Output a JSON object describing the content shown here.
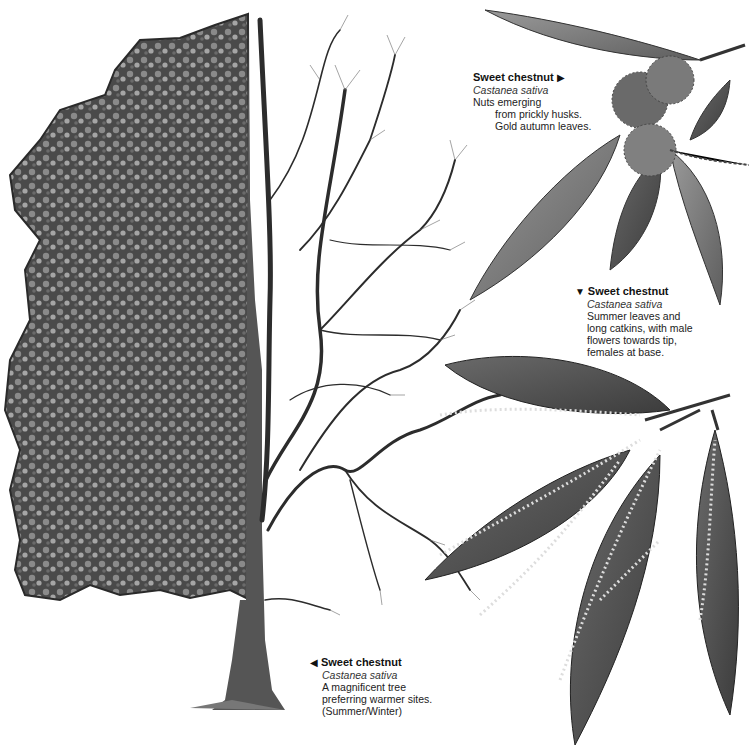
{
  "captions": [
    {
      "id": "nuts",
      "marker": "right-pointer",
      "marker_glyph": "▶",
      "title": "Sweet chestnut",
      "latin": "Castanea sativa",
      "lines": [
        "Nuts emerging",
        "from prickly husks.",
        "Gold autumn leaves."
      ]
    },
    {
      "id": "catkins",
      "marker": "down-pointer",
      "marker_glyph": "▼",
      "title": "Sweet chestnut",
      "latin": "Castanea sativa",
      "lines": [
        "Summer leaves and",
        "long catkins, with male",
        "flowers towards tip,",
        "females at base."
      ]
    },
    {
      "id": "tree",
      "marker": "left-pointer",
      "marker_glyph": "◀",
      "title": "Sweet chestnut",
      "latin": "Castanea sativa",
      "lines": [
        "A magnificent tree",
        "preferring warmer sites.",
        "(Summer/Winter)"
      ]
    }
  ],
  "colors": {
    "ink": "#1a1a1a",
    "foliage_dark": "#3a3a3a",
    "foliage_mid": "#7a7a7a",
    "foliage_light": "#b5b5b5",
    "leaf": "#6e6e6e",
    "background": "#ffffff"
  }
}
